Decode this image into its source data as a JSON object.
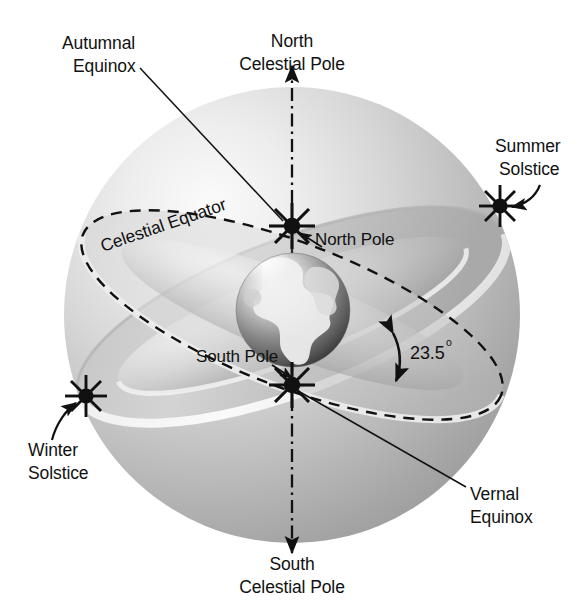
{
  "figure": {
    "background_color": "#ffffff",
    "ink_color": "#111111"
  },
  "labels": {
    "autumnal_equinox_line1": "Autumnal",
    "autumnal_equinox_line2": "Equinox",
    "north_celestial_pole_line1": "North",
    "north_celestial_pole_line2": "Celestial Pole",
    "summer_solstice_line1": "Summer",
    "summer_solstice_line2": "Solstice",
    "celestial_equator": "Celestial Equator",
    "north_pole": "North Pole",
    "south_pole": "South Pole",
    "tilt_value": "23.5",
    "tilt_degree_symbol": "o",
    "winter_solstice_line1": "Winter",
    "winter_solstice_line2": "Solstice",
    "vernal_equinox_line1": "Vernal",
    "vernal_equinox_line2": "Equinox",
    "south_celestial_pole_line1": "South",
    "south_celestial_pole_line2": "Celestial Pole"
  },
  "markers": {
    "autumnal_equinox_point": "star-burst",
    "vernal_equinox_point": "star-burst",
    "summer_solstice_point": "star-burst",
    "winter_solstice_point": "star-burst"
  },
  "colors": {
    "sphere_light": "#f2f2f2",
    "sphere_mid": "#c9c9c9",
    "sphere_dark": "#8f8f8f",
    "band_light": "#e8e8e8",
    "band_shade": "#b4b4b4",
    "earth_dark": "#4a4a4a",
    "earth_light": "#f5f5f5",
    "line": "#111111"
  },
  "geometry": {
    "sphere_center_x": 292,
    "sphere_center_y": 315,
    "sphere_radius": 228,
    "earth_center_x": 293,
    "earth_center_y": 310,
    "earth_radius": 57,
    "north_pole_point_x": 292,
    "north_pole_point_y": 226,
    "south_pole_point_x": 292,
    "south_pole_point_y": 385,
    "summer_solstice_point_x": 500,
    "summer_solstice_point_y": 206,
    "winter_solstice_point_x": 86,
    "winter_solstice_point_y": 396,
    "celestial_equator_tilt_deg": -21,
    "ecliptic_tilt_deg": 21,
    "obliquity_deg": 23.5
  }
}
